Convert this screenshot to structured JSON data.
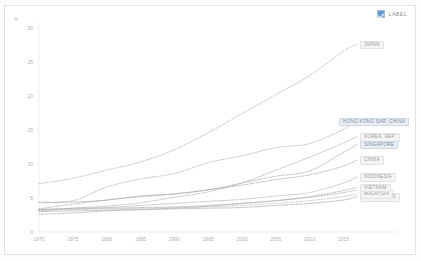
{
  "header": {
    "label_toggle": "LABEL",
    "label_toggle_checked": true,
    "checkbox_icon": "checkbox-checked-icon"
  },
  "axis": {
    "y_unit": "%",
    "y_ticks": [
      "0",
      "5",
      "10",
      "15",
      "20",
      "25",
      "30"
    ],
    "x_ticks": [
      "1970",
      "1975",
      "1980",
      "1985",
      "1990",
      "1995",
      "2000",
      "2005",
      "2010",
      "2015"
    ]
  },
  "colors": {
    "accent": "#6c9bd2",
    "grid": "#e0e0e0",
    "tick_text": "#b0b0b0",
    "label_text": "#9a9a9a",
    "label_bg": "#f4f4f4",
    "highlight_bg": "#e9eef4"
  },
  "chart_data": {
    "type": "line",
    "title": "",
    "subtitle": "",
    "xlabel": "",
    "ylabel": "%",
    "xlim": [
      1970,
      2017
    ],
    "ylim": [
      0,
      30
    ],
    "grid": false,
    "legend_position": "inline-end-of-line",
    "x": [
      1970,
      1975,
      1980,
      1985,
      1990,
      1995,
      2000,
      2005,
      2010,
      2015,
      2017
    ],
    "series": [
      {
        "name": "JAPAN",
        "color": "#a8a8a8",
        "dash": "1,1.6",
        "highlight": false,
        "values": [
          7.1,
          7.9,
          9.1,
          10.3,
          12.1,
          14.6,
          17.4,
          20.2,
          23.0,
          26.6,
          27.6
        ]
      },
      {
        "name": "HONG KONG SAR, CHINA",
        "color": "#a8a8a8",
        "dash": "1,1.6",
        "highlight": true,
        "values": [
          4.4,
          4.6,
          6.6,
          7.8,
          8.6,
          10.2,
          11.2,
          12.4,
          13.0,
          15.1,
          16.3
        ]
      },
      {
        "name": "KOREA, REP.",
        "color": "#a8a8a8",
        "dash": "0.9,1.4",
        "highlight": false,
        "values": [
          3.1,
          3.5,
          3.8,
          4.3,
          5.1,
          5.9,
          7.2,
          9.1,
          11.0,
          13.1,
          14.0
        ]
      },
      {
        "name": "CHINA",
        "color": "#a8a8a8",
        "dash": "1.2,1.2",
        "highlight": false,
        "values": [
          4.3,
          4.4,
          4.7,
          5.3,
          5.6,
          6.2,
          6.9,
          7.7,
          8.4,
          9.7,
          10.6
        ]
      },
      {
        "name": "SINGAPORE",
        "color": "#8fa3b8",
        "dash": "1,1.5",
        "highlight": true,
        "values": [
          3.4,
          4.1,
          4.7,
          5.2,
          5.6,
          6.2,
          7.2,
          8.2,
          9.0,
          11.7,
          12.9
        ]
      },
      {
        "name": "INDONESIA",
        "color": "#a8a8a8",
        "dash": "0.8,1.3",
        "highlight": false,
        "values": [
          3.3,
          3.5,
          3.6,
          3.9,
          4.2,
          4.5,
          4.8,
          5.3,
          5.8,
          7.2,
          8.1
        ]
      },
      {
        "name": "PHILIPPINES",
        "color": "#a8a8a8",
        "dash": "1.4,1.1",
        "highlight": false,
        "values": [
          3.0,
          3.1,
          3.2,
          3.3,
          3.4,
          3.5,
          3.6,
          3.9,
          4.2,
          4.7,
          5.2
        ]
      },
      {
        "name": "INDIA",
        "color": "#a8a8a8",
        "dash": "0.7,1.2",
        "highlight": false,
        "values": [
          3.3,
          3.4,
          3.5,
          3.6,
          3.7,
          3.9,
          4.2,
          4.6,
          5.1,
          5.8,
          6.2
        ]
      },
      {
        "name": "MALAYSIA",
        "color": "#b4b4b4",
        "dash": "1.1,1.7",
        "highlight": false,
        "values": [
          3.2,
          3.3,
          3.4,
          3.5,
          3.6,
          3.7,
          3.9,
          4.2,
          4.6,
          5.2,
          5.6
        ]
      },
      {
        "name": "VIETNAM",
        "color": "#a8a8a8",
        "dash": "1.3,1.3",
        "highlight": false,
        "values": [
          2.6,
          2.8,
          3.1,
          3.3,
          3.5,
          3.8,
          4.2,
          4.6,
          5.2,
          6.1,
          6.6
        ]
      }
    ]
  }
}
